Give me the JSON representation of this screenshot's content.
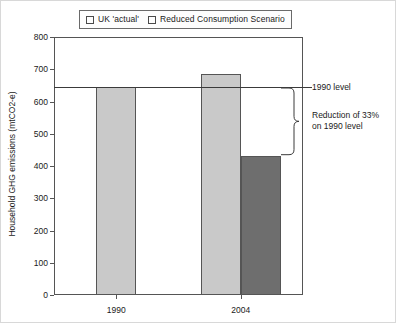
{
  "chart_data": {
    "type": "bar",
    "title": "",
    "xlabel": "",
    "ylabel": "Household GHG emissions (mtCO2-e)",
    "categories": [
      "1990",
      "2004"
    ],
    "series": [
      {
        "name": "UK 'actual'",
        "values": [
          645,
          685
        ],
        "color": "#c9c9c9"
      },
      {
        "name": "Reduced Consumption Scenario",
        "values": [
          null,
          432
        ],
        "color": "#6e6e6e"
      }
    ],
    "ylim": [
      0,
      800
    ],
    "yticks": [
      0,
      100,
      200,
      300,
      400,
      500,
      600,
      700,
      800
    ],
    "ytick_labels": [
      "0",
      "100",
      "200",
      "300",
      "400",
      "500",
      "600",
      "700",
      "800"
    ],
    "grid": false,
    "legend_position": "top",
    "reference_lines": [
      {
        "label": "1990 level",
        "value": 645
      }
    ],
    "annotations": [
      {
        "label": "1990 level",
        "value": 645
      },
      {
        "label": "Reduction of 33%",
        "label2": "on 1990 level",
        "from": 645,
        "to": 432,
        "percent": 33
      }
    ]
  },
  "legend": {
    "items": [
      {
        "label": "UK 'actual'",
        "color": "#c9c9c9"
      },
      {
        "label": "Reduced Consumption Scenario",
        "color": "#6e6e6e"
      }
    ]
  },
  "axis": {
    "y_title": "Household GHG emissions (mtCO2-e)",
    "y_ticks": [
      "800",
      "700",
      "600",
      "500",
      "400",
      "300",
      "200",
      "100",
      "0"
    ],
    "x_ticks": [
      "1990",
      "2004"
    ]
  },
  "annotations": {
    "ref_label": "1990 level",
    "reduction_line1": "Reduction of 33%",
    "reduction_line2": "on 1990 level"
  }
}
